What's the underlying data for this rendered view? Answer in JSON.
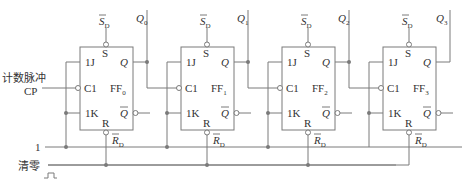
{
  "diagram": {
    "colors": {
      "wire": "#7a7a7a",
      "text": "#333333",
      "background": "#ffffff"
    },
    "inputs": {
      "clock_label": "计数脉冲",
      "cp_label": "CP",
      "one_label": "1",
      "clear_label": "清零"
    },
    "pin_labels": {
      "j": "1J",
      "k": "1K",
      "clk": "C1",
      "s": "S",
      "r": "R",
      "q": "Q",
      "qbar": "Q",
      "sd": "S",
      "sd_sub": "D",
      "rd": "R",
      "rd_sub": "D",
      "ff": "FF"
    },
    "flipflops": [
      {
        "name": "FF",
        "index": "0",
        "output": "Q",
        "output_index": "0"
      },
      {
        "name": "FF",
        "index": "1",
        "output": "Q",
        "output_index": "1"
      },
      {
        "name": "FF",
        "index": "2",
        "output": "Q",
        "output_index": "2"
      },
      {
        "name": "FF",
        "index": "3",
        "output": "Q",
        "output_index": "3"
      }
    ]
  }
}
